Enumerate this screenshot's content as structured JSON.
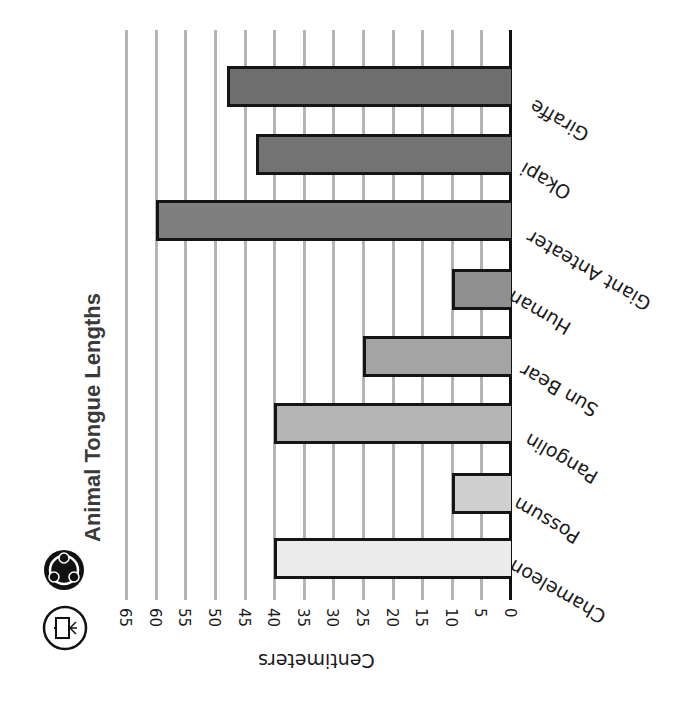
{
  "title": "Animal Tongue Lengths",
  "icons": {
    "group": "group-circle-icon",
    "whiteboard": "presentation-board-icon"
  },
  "axis": {
    "label": "Centimeters",
    "ticks": [
      "0",
      "5",
      "10",
      "15",
      "20",
      "25",
      "30",
      "35",
      "40",
      "45",
      "50",
      "55",
      "60",
      "65"
    ]
  },
  "bars": [
    {
      "label": "Giraffe",
      "value": 48,
      "color": "#6e6e6e"
    },
    {
      "label": "Okapi",
      "value": 43,
      "color": "#737373"
    },
    {
      "label": "Giant Anteater",
      "value": 60,
      "color": "#7f7f7f"
    },
    {
      "label": "Human",
      "value": 10,
      "color": "#8f8f8f"
    },
    {
      "label": "Sun Bear",
      "value": 25,
      "color": "#a4a4a4"
    },
    {
      "label": "Pangolin",
      "value": 40,
      "color": "#b5b5b5"
    },
    {
      "label": "Possum",
      "value": 10,
      "color": "#cfcfcf"
    },
    {
      "label": "Chameleon",
      "value": 40,
      "color": "#ebebeb"
    }
  ],
  "chart_data": {
    "type": "bar",
    "orientation": "horizontal",
    "title": "Animal Tongue Lengths",
    "categories": [
      "Giraffe",
      "Okapi",
      "Giant Anteater",
      "Human",
      "Sun Bear",
      "Pangolin",
      "Possum",
      "Chameleon"
    ],
    "values": [
      48,
      43,
      60,
      10,
      25,
      40,
      10,
      40
    ],
    "xlabel": "Centimeters",
    "ylabel": "",
    "xlim": [
      0,
      65
    ],
    "tick_step": 5,
    "grid": true,
    "legend": null,
    "note": "Figure is displayed rotated ~180 degrees (upside-down) with title rotated vertically"
  }
}
